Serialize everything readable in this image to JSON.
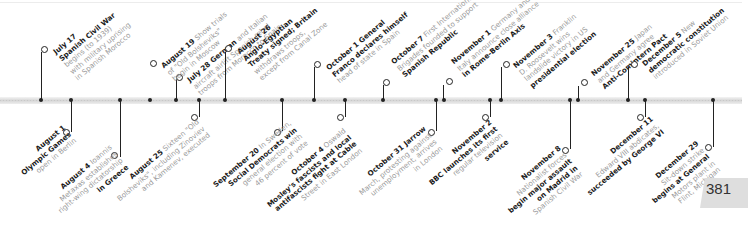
{
  "page_number": "381",
  "timeline": {
    "above": [
      {
        "id": "jul17",
        "x": 40,
        "stem_top": 28,
        "lines": [
          [
            "July 17",
            ""
          ],
          [
            "Spanish Civil War",
            ""
          ],
          [
            "",
            "begins (to 1939)"
          ],
          [
            "",
            "with military uprising"
          ],
          [
            "",
            "in Spanish Morocco"
          ]
        ]
      },
      {
        "id": "jul28",
        "x": 176,
        "stem_top": 70,
        "lines": [
          [
            "July 28 German",
            "and Italian"
          ],
          [
            "aircraft",
            "airlift Spanish rebel"
          ],
          [
            "",
            "troops from Morocco to Spain"
          ]
        ]
      },
      {
        "id": "aug19",
        "x": 440,
        "stem_top": 0,
        "lines": []
      },
      {
        "id": "aug19b",
        "x": 150,
        "stem_top": 0,
        "lines": []
      }
    ],
    "events_above": [
      {
        "id": "jul17",
        "x": 41,
        "y": 52,
        "bold1": "July 17",
        "text": [
          "Spanish Civil War",
          "begins (to 1939)",
          "with military uprising",
          "in Spanish Morocco"
        ],
        "bold_lines": [
          0
        ]
      },
      {
        "id": "jul28",
        "x": 176,
        "y": 79,
        "bold1": "July 28 German",
        "rest1": " and Italian",
        "text": [
          "aircraft airlift Spanish rebel",
          "troops from Morocco to Spain"
        ]
      },
      {
        "id": "aug19",
        "x": 150,
        "y": 63,
        "bold1": "August 19",
        "rest1": " Show trials",
        "text": [
          "of \"Old Bolsheviks\"",
          "begin in Moscow"
        ]
      },
      {
        "id": "aug26",
        "x": 222,
        "y": 47,
        "bold1": "August 26",
        "text": [
          "Anglo-Egyptian",
          "Treaty signed; Britain",
          "withdraws troops,",
          "except from Canal Zone"
        ]
      },
      {
        "id": "oct1",
        "x": 317,
        "y": 65,
        "bold1": "October 1",
        "rest1": " General",
        "text": [
          "Franco declares himself",
          "head of state in Spain"
        ]
      },
      {
        "id": "oct7",
        "x": 385,
        "y": 81,
        "bold1": "October 7",
        "rest1": " First International",
        "text": [
          "Brigades founded to support",
          "Spanish Republic"
        ]
      },
      {
        "id": "nov1",
        "x": 448,
        "y": 81,
        "bold1": "November 1",
        "rest1": " Germany and",
        "text": [
          "Italy announce close alliance",
          "in Rome-Berlin Axis"
        ]
      },
      {
        "id": "nov3",
        "x": 503,
        "y": 65,
        "bold1": "November 3",
        "rest1": " Franklin",
        "text": [
          "D. Roosevelt wins",
          "landslide victory in US",
          "presidential election"
        ]
      },
      {
        "id": "nov25",
        "x": 579,
        "y": 80,
        "bold1": "November 25",
        "rest1": " Japan",
        "text": [
          "and Germany agree",
          "Anti-Comintern Pact"
        ]
      },
      {
        "id": "dec5",
        "x": 628,
        "y": 63,
        "bold1": "December 5",
        "rest1": " New",
        "text": [
          "democratic constitution",
          "introduced in Soviet Union"
        ]
      }
    ],
    "events_below": [
      {
        "id": "aug1",
        "x": 70,
        "y": 133,
        "bold1": "August 1",
        "text": [
          "Olympic Games",
          "open in Berlin"
        ]
      },
      {
        "id": "aug4",
        "x": 117,
        "y": 158,
        "bold1": "August 4",
        "rest1": " Ioannis",
        "text": [
          "Metaxas establishes",
          "right-wing dictatorship",
          "in Greece"
        ]
      },
      {
        "id": "aug25",
        "x": 192,
        "y": 117,
        "bold1": "August 25",
        "rest1": " Sixteen \"Old",
        "text": [
          "Bolsheviks\", including Zinoviev",
          "and Kamenev, executed"
        ]
      },
      {
        "id": "sep20",
        "x": 276,
        "y": 133,
        "bold1": "September 20",
        "rest1": " In Sweden,",
        "text": [
          "Social Democrats win",
          "general election with",
          "46 percent of vote"
        ]
      },
      {
        "id": "oct4",
        "x": 340,
        "y": 116,
        "bold1": "October 4",
        "rest1": " Oswald",
        "text": [
          "Mosley's fascists and local",
          "antifascists fight at Cable",
          "Street in East London"
        ]
      },
      {
        "id": "oct31",
        "x": 419,
        "y": 133,
        "bold1": "October 31",
        "rest1": " Jarrow",
        "text": [
          "March, protesting against",
          "unemployment, arrives",
          "in London"
        ]
      },
      {
        "id": "nov2",
        "x": 486,
        "y": 117,
        "bold1": "November 2",
        "text": [
          "BBC launches its first",
          "regular television",
          "service"
        ]
      },
      {
        "id": "nov8",
        "x": 560,
        "y": 150,
        "bold1": "November 8",
        "text": [
          "Nationalist forces",
          "begin major assault",
          "on Madrid in",
          "Spanish Civil War"
        ]
      },
      {
        "id": "dec11",
        "x": 633,
        "y": 117,
        "bold1": "December 11",
        "text": [
          "Edward VIII abdicates,",
          "succeeded by George VI"
        ]
      },
      {
        "id": "dec29",
        "x": 706,
        "y": 150,
        "bold1": "December 29",
        "text": [
          "Sit-down strike",
          "begins at General",
          "Motors plant in",
          "Flint, Michigan"
        ]
      }
    ]
  }
}
